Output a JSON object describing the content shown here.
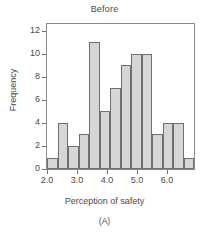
{
  "chart_data": {
    "type": "bar",
    "title": "Before",
    "subtitle": "(A)",
    "xlabel": "Perception of safety",
    "ylabel": "Frequency",
    "bin_width": 0.35,
    "bin_edges": [
      2.0,
      2.35,
      2.7,
      3.05,
      3.4,
      3.75,
      4.1,
      4.45,
      4.8,
      5.15,
      5.5,
      5.85,
      6.2,
      6.55,
      6.9
    ],
    "categories": [
      "2.0-2.35",
      "2.35-2.7",
      "2.7-3.05",
      "3.05-3.4",
      "3.4-3.75",
      "3.75-4.1",
      "4.1-4.45",
      "4.45-4.8",
      "4.8-5.15",
      "5.15-5.5",
      "5.5-5.85",
      "5.85-6.2",
      "6.2-6.55",
      "6.55-6.9"
    ],
    "values": [
      1,
      4,
      2,
      3,
      11,
      5,
      7,
      9,
      10,
      10,
      3,
      4,
      4,
      1
    ],
    "xlim": [
      2.0,
      6.9
    ],
    "ylim": [
      0,
      12.6
    ],
    "xticks": [
      2.0,
      3.0,
      4.0,
      5.0,
      6.0
    ],
    "xtick_labels": [
      "2.0",
      "3.0",
      "4.0",
      "5.0",
      "6.0"
    ],
    "yticks": [
      0,
      2,
      4,
      6,
      8,
      10,
      12
    ],
    "ytick_labels": [
      "0",
      "2",
      "4",
      "6",
      "8",
      "10",
      "12"
    ],
    "grid": false,
    "legend": null,
    "bar_fill_color": "#d6d6d6",
    "bar_border_color": "#707070",
    "axis_color": "#8a8a8a",
    "text_color": "#4a4a4a"
  }
}
